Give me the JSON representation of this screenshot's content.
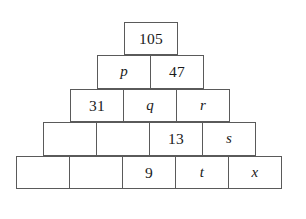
{
  "figure": {
    "rows": [
      {
        "index": 1,
        "cells": [
          {
            "label": "105",
            "kind": "number"
          }
        ]
      },
      {
        "index": 2,
        "cells": [
          {
            "label": "p",
            "kind": "variable"
          },
          {
            "label": "47",
            "kind": "number"
          }
        ]
      },
      {
        "index": 3,
        "cells": [
          {
            "label": "31",
            "kind": "number"
          },
          {
            "label": "q",
            "kind": "variable"
          },
          {
            "label": "r",
            "kind": "variable"
          }
        ]
      },
      {
        "index": 4,
        "cells": [
          {
            "label": "",
            "kind": "empty"
          },
          {
            "label": "",
            "kind": "empty"
          },
          {
            "label": "13",
            "kind": "number"
          },
          {
            "label": "s",
            "kind": "variable"
          }
        ]
      },
      {
        "index": 5,
        "cells": [
          {
            "label": "",
            "kind": "empty"
          },
          {
            "label": "",
            "kind": "empty"
          },
          {
            "label": "9",
            "kind": "number"
          },
          {
            "label": "t",
            "kind": "variable"
          },
          {
            "label": "x",
            "kind": "variable"
          }
        ]
      }
    ]
  },
  "colors": {
    "background": "#ffffff",
    "border": "#5a5a5a",
    "text": "#1a1a1a"
  }
}
